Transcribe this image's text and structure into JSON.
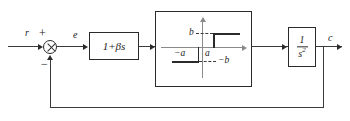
{
  "diagram": {
    "signals": {
      "input_label": "r",
      "error_label": "e",
      "output_label": "c"
    },
    "summing_junction": {
      "name": "summing-junction",
      "plus_sign": "+",
      "minus_sign": "−"
    },
    "blocks": [
      {
        "id": "compensator",
        "label": "1 + βs",
        "label_plain": "1+βs"
      },
      {
        "id": "relay",
        "label": "relay with hysteresis"
      },
      {
        "id": "plant",
        "numerator": "1",
        "denominator": "s",
        "denominator_exponent": "2",
        "label_plain": "1/s²"
      }
    ],
    "relay_characteristic": {
      "type": "hysteresis",
      "upper_output_label": "b",
      "lower_output_label": "−b",
      "right_threshold_label": "a",
      "left_threshold_label": "−a",
      "vertical_axis": "output",
      "horizontal_axis": "input"
    },
    "feedback": {
      "name": "unity-feedback-path",
      "sign": "−"
    },
    "colors": {
      "line": "#3a3a3a",
      "box_border": "#2b2b2b",
      "background": "#ffffff",
      "axis": "#8a8a8a"
    }
  }
}
